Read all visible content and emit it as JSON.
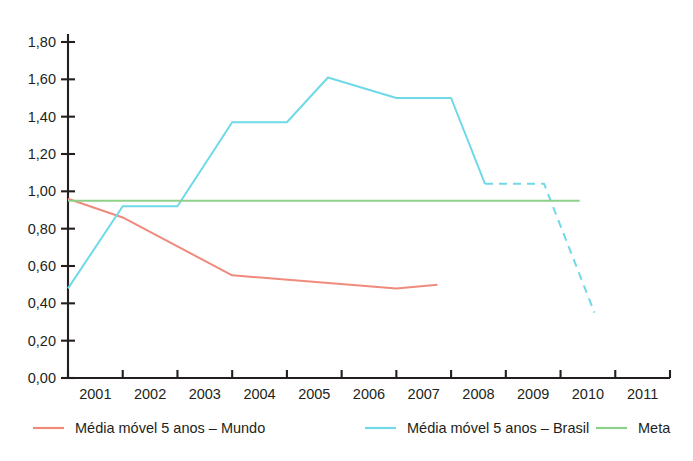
{
  "chart_data": {
    "type": "line",
    "title": "",
    "xlabel": "",
    "ylabel": "",
    "xlim": [
      2001,
      2012
    ],
    "ylim": [
      0.0,
      1.8
    ],
    "grid": false,
    "legend_position": "bottom",
    "x_tick_labels": [
      "2001",
      "2002",
      "2003",
      "2004",
      "2005",
      "2006",
      "2007",
      "2008",
      "2009",
      "2010",
      "2011"
    ],
    "y_tick_labels": [
      "0,00",
      "0,20",
      "0,40",
      "0,60",
      "0,80",
      "1,00",
      "1,20",
      "1,40",
      "1,60",
      "1,80"
    ],
    "y_tick_values": [
      0.0,
      0.2,
      0.4,
      0.6,
      0.8,
      1.0,
      1.2,
      1.4,
      1.6,
      1.8
    ],
    "x_tick_values": [
      2001,
      2002,
      2003,
      2004,
      2005,
      2006,
      2007,
      2008,
      2009,
      2010,
      2011,
      2012
    ],
    "series": [
      {
        "name": "Média móvel 5 anos – Mundo",
        "key": "mundo",
        "color": "#f08a7c",
        "style": "solid",
        "x": [
          2001.0,
          2002.0,
          2004.0,
          2007.0,
          2007.75
        ],
        "values": [
          0.96,
          0.86,
          0.55,
          0.48,
          0.5
        ]
      },
      {
        "name": "Média móvel 5 anos – Brasil",
        "key": "brasil",
        "color": "#6fd9e8",
        "style": "solid",
        "x": [
          2001.0,
          2002.0,
          2003.0,
          2004.0,
          2005.0,
          2005.75,
          2007.0,
          2008.0,
          2008.62
        ],
        "values": [
          0.48,
          0.92,
          0.92,
          1.37,
          1.37,
          1.61,
          1.5,
          1.5,
          1.04
        ]
      },
      {
        "name": "Média móvel 5 anos – Brasil (projeção)",
        "key": "brasil_proj",
        "color": "#6fd9e8",
        "style": "dashed",
        "x": [
          2008.62,
          2009.7,
          2010.62
        ],
        "values": [
          1.04,
          1.04,
          0.35
        ]
      },
      {
        "name": "Meta",
        "key": "meta",
        "color": "#8ed08b",
        "style": "solid",
        "x": [
          2001.0,
          2010.35
        ],
        "values": [
          0.95,
          0.95
        ]
      }
    ]
  },
  "legend": {
    "items": [
      {
        "label": "Média móvel 5 anos – Mundo",
        "color": "#f08a7c"
      },
      {
        "label": "Média móvel 5 anos – Brasil",
        "color": "#6fd9e8"
      },
      {
        "label": "Meta",
        "color": "#8ed08b"
      }
    ]
  },
  "clipped_header": {
    "text": ""
  }
}
